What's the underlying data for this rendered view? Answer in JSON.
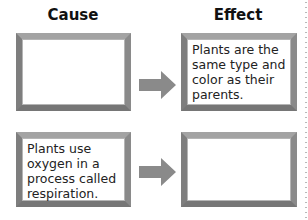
{
  "headings": {
    "cause": "Cause",
    "effect": "Effect"
  },
  "rows": [
    {
      "cause": "",
      "effect": "Plants are the same type and color as their parents."
    },
    {
      "cause": "Plants use oxygen in a process called respiration.",
      "effect": ""
    }
  ],
  "colors": {
    "frame": "#8f8f8f",
    "arrow": "#8a8a8a"
  }
}
